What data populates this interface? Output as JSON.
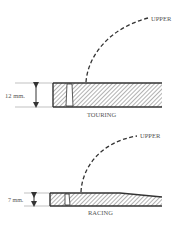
{
  "diagrams": [
    {
      "name": "touring",
      "label": "TOURING",
      "thickness_label": "12 mm.",
      "upper_label": "UPPER"
    },
    {
      "name": "racing",
      "label": "RACING",
      "thickness_label": "7 mm.",
      "upper_label": "UPPER"
    }
  ],
  "colors": {
    "line": "#333333",
    "hatch": "#555555",
    "text": "#555555"
  }
}
